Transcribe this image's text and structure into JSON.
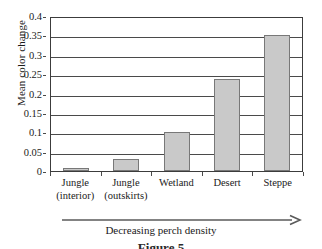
{
  "chart_data": {
    "type": "bar",
    "title": "",
    "subtitle": "",
    "xlabel": "Decreasing perch density",
    "ylabel": "Mean color change",
    "categories": [
      "Jungle (interior)",
      "Jungle (outskirts)",
      "Wetland",
      "Desert",
      "Steppe"
    ],
    "category_lines": [
      [
        "Jungle",
        "(interior)"
      ],
      [
        "Jungle",
        "(outskirts)"
      ],
      [
        "Wetland",
        ""
      ],
      [
        "Desert",
        ""
      ],
      [
        "Steppe",
        ""
      ]
    ],
    "values": [
      0.008,
      0.03,
      0.1,
      0.2375,
      0.35
    ],
    "ylim": [
      0,
      0.4
    ],
    "ytick_labels": [
      "0",
      "0.05",
      "0.1",
      "0.15",
      "0.2",
      "0.25",
      "0.3",
      "0.35",
      "0.4"
    ],
    "ytick_values": [
      0,
      0.05,
      0.1,
      0.15,
      0.2,
      0.25,
      0.3,
      0.35,
      0.4
    ],
    "grid": true,
    "legend": null,
    "bar_color": "#c9c9c9",
    "bar_border_color": "#787878",
    "axis_color": "#3c3c3c",
    "grid_color": "#4a4a4a"
  },
  "annotations": {
    "axis_arrow_label": "Decreasing perch density",
    "axis_arrow_direction": "right"
  },
  "caption": {
    "text": "Figure 5"
  }
}
